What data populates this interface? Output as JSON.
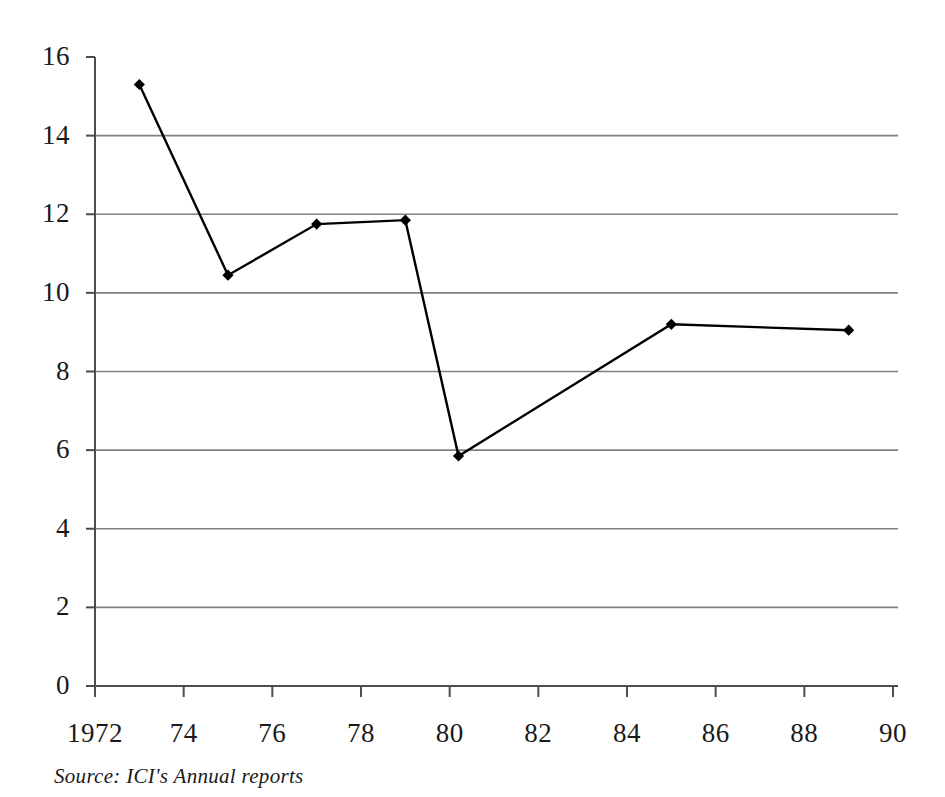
{
  "chart_data": {
    "type": "line",
    "title": "",
    "subtitle": "",
    "xlabel": "",
    "ylabel": "",
    "xlim": [
      1972,
      1990
    ],
    "ylim": [
      0,
      16
    ],
    "grid": "horizontal",
    "legend": "none",
    "marker": "diamond",
    "line_color": "#000000",
    "grid_color": "#808080",
    "axis_color": "#4d4d4d",
    "x": [
      1973,
      1975,
      1977,
      1979,
      1980.2,
      1985,
      1989
    ],
    "values": [
      15.3,
      10.45,
      11.75,
      11.85,
      5.85,
      9.2,
      9.05
    ],
    "series": [
      {
        "name": "ICI",
        "x": [
          1973,
          1975,
          1977,
          1979,
          1980.2,
          1985,
          1989
        ],
        "values": [
          15.3,
          10.45,
          11.75,
          11.85,
          5.85,
          9.2,
          9.05
        ]
      }
    ],
    "xticks": [
      1972,
      1974,
      1976,
      1978,
      1980,
      1982,
      1984,
      1986,
      1988,
      1990
    ],
    "xtick_labels": [
      "1972",
      "74",
      "76",
      "78",
      "80",
      "82",
      "84",
      "86",
      "88",
      "90"
    ],
    "yticks": [
      0,
      2,
      4,
      6,
      8,
      10,
      12,
      14,
      16
    ],
    "ytick_labels": [
      "0",
      "2",
      "4",
      "6",
      "8",
      "10",
      "12",
      "14",
      "16"
    ],
    "annotations": []
  },
  "caption": {
    "source_text": "Source: ICI's Annual reports"
  }
}
